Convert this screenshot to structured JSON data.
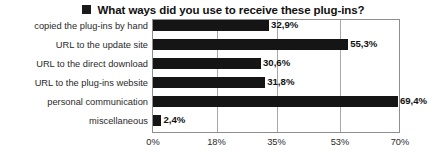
{
  "chart_data": {
    "type": "bar",
    "orientation": "horizontal",
    "title": "What ways did you use to receive these plug-ins?",
    "title_marker": "black-square-marker",
    "xlabel": "",
    "ylabel": "",
    "xlim": [
      0,
      70
    ],
    "grid": true,
    "legend": "none",
    "categories": [
      "copied the plug-ins by hand",
      "URL to the update site",
      "URL to the direct download",
      "URL to the plug-ins website",
      "personal communication",
      "miscellaneous"
    ],
    "values": [
      32.9,
      55.3,
      30.6,
      31.8,
      69.4,
      2.4
    ],
    "value_labels": [
      "32,9%",
      "55,3%",
      "30,6%",
      "31,8%",
      "69,4%",
      "2,4%"
    ],
    "xticks": [
      0,
      18,
      35,
      53,
      70
    ],
    "xtick_labels": [
      "0%",
      "18%",
      "35%",
      "53%",
      "70%"
    ],
    "bar_color": "#151515",
    "grid_color": "#a8a8a8",
    "frame_color": "#8e8e8e",
    "background": "#ffffff"
  }
}
